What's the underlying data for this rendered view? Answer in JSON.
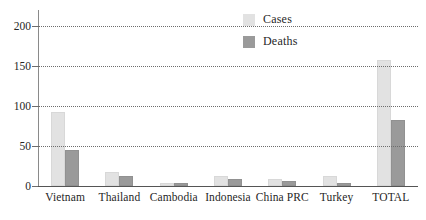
{
  "chart_data": {
    "type": "bar",
    "title": "",
    "subtitle": "",
    "xlabel": "",
    "ylabel": "",
    "ylim": [
      0,
      220
    ],
    "yticks": [
      0,
      50,
      100,
      150,
      200
    ],
    "ytick_labels": [
      "0",
      "50",
      "100",
      "150",
      "200"
    ],
    "grid": true,
    "grid_style": "dotted-horizontal",
    "legend_position": "top-right",
    "categories": [
      "Vietnam",
      "Thailand",
      "Cambodia",
      "Indonesia",
      "China PRC",
      "Turkey",
      "TOTAL"
    ],
    "series": [
      {
        "name": "Cases",
        "color": "#e2e2e2",
        "values": [
          93,
          17,
          4,
          13,
          9,
          12,
          157
        ]
      },
      {
        "name": "Deaths",
        "color": "#9a9a9a",
        "values": [
          45,
          12,
          4,
          9,
          6,
          4,
          82
        ]
      }
    ]
  },
  "legend": {
    "items": [
      {
        "label": "Cases",
        "swatch": "cases-swatch"
      },
      {
        "label": "Deaths",
        "swatch": "deaths-swatch"
      }
    ]
  }
}
